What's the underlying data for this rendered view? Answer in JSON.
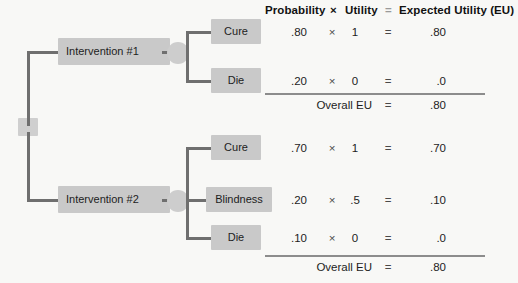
{
  "diagram": {
    "title_row": {
      "probability": "Probability",
      "times": "×",
      "utility": "Utility",
      "equals": "=",
      "expected_utility": "Expected Utility (EU)"
    },
    "root": {
      "label": ""
    },
    "branches": [
      {
        "name": "Intervention #1",
        "outcomes": [
          {
            "label": "Cure",
            "probability": ".80",
            "utility": "1",
            "eu": ".80"
          },
          {
            "label": "Die",
            "probability": ".20",
            "utility": "0",
            "eu": ".0"
          }
        ],
        "overall_label": "Overall EU",
        "overall_equals": "=",
        "overall_eu": ".80"
      },
      {
        "name": "Intervention #2",
        "outcomes": [
          {
            "label": "Cure",
            "probability": ".70",
            "utility": "1",
            "eu": ".70"
          },
          {
            "label": "Blindness",
            "probability": ".20",
            "utility": ".5",
            "eu": ".10"
          },
          {
            "label": "Die",
            "probability": ".10",
            "utility": "0",
            "eu": ".0"
          }
        ],
        "overall_label": "Overall EU",
        "overall_equals": "=",
        "overall_eu": ".80"
      }
    ],
    "operators": {
      "times": "×",
      "equals": "="
    }
  },
  "colors": {
    "background": "#f8f8f6",
    "box_fill": "#c9c9c9",
    "node_fill": "#cdcdcd",
    "line": "#6f6f6f",
    "text": "#1d1d1d",
    "rule": "#8c8c8c"
  }
}
